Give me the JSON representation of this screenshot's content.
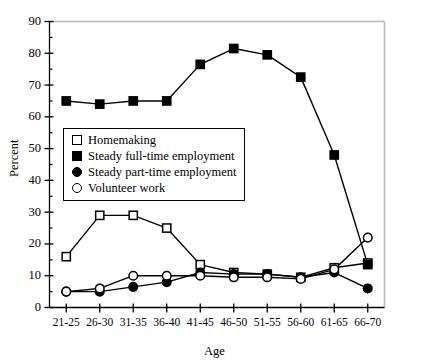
{
  "chart_data": {
    "type": "line",
    "title": "",
    "xlabel": "Age",
    "ylabel": "Percent",
    "categories": [
      "21-25",
      "26-30",
      "31-35",
      "36-40",
      "41-45",
      "46-50",
      "51-55",
      "56-60",
      "61-65",
      "66-70"
    ],
    "ylim": [
      0,
      90
    ],
    "ytick_values": [
      0,
      10,
      20,
      30,
      40,
      50,
      60,
      70,
      80,
      90
    ],
    "ytick_labels": [
      "0",
      "10",
      "20",
      "30",
      "40",
      "50",
      "60",
      "70",
      "80",
      "90"
    ],
    "yminor_step": 5,
    "grid": false,
    "legend_position": "upper left inside",
    "series": [
      {
        "name": "Homemaking",
        "marker": "open-square",
        "values": [
          16,
          29,
          29,
          25,
          13.5,
          11,
          10.5,
          9.5,
          12.5,
          14
        ]
      },
      {
        "name": "Steady full-time employment",
        "marker": "filled-square",
        "values": [
          65,
          64,
          65,
          65,
          76.5,
          81.5,
          79.5,
          72.5,
          48,
          13.5
        ]
      },
      {
        "name": "Steady part-time employment",
        "marker": "filled-circle",
        "values": [
          5,
          5,
          6.5,
          8,
          11,
          10.5,
          10.5,
          9.5,
          11,
          6
        ]
      },
      {
        "name": "Volunteer work",
        "marker": "open-circle",
        "values": [
          5,
          6,
          10,
          10,
          10,
          9.5,
          9.5,
          9,
          12,
          22
        ]
      }
    ]
  },
  "legend": {
    "items": [
      {
        "label": "Homemaking",
        "marker": "open-square"
      },
      {
        "label": "Steady full-time employment",
        "marker": "filled-square"
      },
      {
        "label": "Steady part-time employment",
        "marker": "filled-circle"
      },
      {
        "label": "Volunteer work",
        "marker": "open-circle"
      }
    ]
  },
  "colors": {
    "line": "#000000",
    "axis": "#000000",
    "frame_light": "#b9b9b9",
    "background": "#ffffff"
  }
}
